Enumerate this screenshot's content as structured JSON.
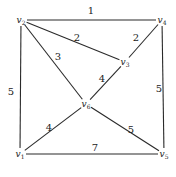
{
  "graph": {
    "title": "",
    "vertices": [
      {
        "id": "v1",
        "name": "v",
        "sub": "1",
        "x": 20,
        "y": 154
      },
      {
        "id": "v2",
        "name": "v",
        "sub": "2",
        "x": 21,
        "y": 20
      },
      {
        "id": "v3",
        "name": "v",
        "sub": "3",
        "x": 125,
        "y": 62
      },
      {
        "id": "v4",
        "name": "v",
        "sub": "4",
        "x": 162,
        "y": 20
      },
      {
        "id": "v5",
        "name": "v",
        "sub": "5",
        "x": 164,
        "y": 154
      },
      {
        "id": "v6",
        "name": "v",
        "sub": "6",
        "x": 86,
        "y": 104
      }
    ],
    "edges": [
      {
        "from": "v2",
        "to": "v4",
        "weight": "1",
        "lx": 91,
        "ly": 14
      },
      {
        "from": "v2",
        "to": "v3",
        "weight": "2",
        "lx": 77,
        "ly": 41
      },
      {
        "from": "v4",
        "to": "v3",
        "weight": "2",
        "lx": 136,
        "ly": 41
      },
      {
        "from": "v2",
        "to": "v6",
        "weight": "3",
        "lx": 58,
        "ly": 60
      },
      {
        "from": "v3",
        "to": "v6",
        "weight": "4",
        "lx": 102,
        "ly": 82
      },
      {
        "from": "v2",
        "to": "v1",
        "weight": "5",
        "lx": 11,
        "ly": 95
      },
      {
        "from": "v4",
        "to": "v5",
        "weight": "5",
        "lx": 159,
        "ly": 92
      },
      {
        "from": "v1",
        "to": "v6",
        "weight": "4",
        "lx": 49,
        "ly": 131
      },
      {
        "from": "v6",
        "to": "v5",
        "weight": "5",
        "lx": 131,
        "ly": 133
      },
      {
        "from": "v1",
        "to": "v5",
        "weight": "7",
        "lx": 95,
        "ly": 151
      }
    ]
  }
}
